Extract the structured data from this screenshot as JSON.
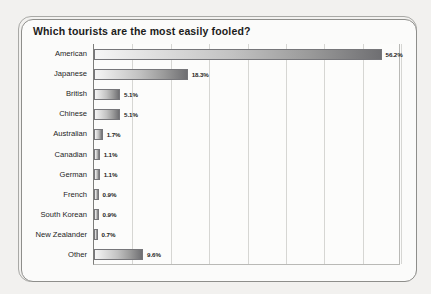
{
  "chart_data": {
    "type": "bar",
    "orientation": "horizontal",
    "title": "Which tourists are the most easily fooled?",
    "xlabel": "",
    "ylabel": "",
    "categories": [
      "American",
      "Japanese",
      "British",
      "Chinese",
      "Australian",
      "Canadian",
      "German",
      "French",
      "South Korean",
      "New Zealander",
      "Other"
    ],
    "values": [
      56.2,
      18.3,
      5.1,
      5.1,
      1.7,
      1.1,
      1.1,
      0.9,
      0.9,
      0.7,
      9.6
    ],
    "value_labels": [
      "56.2%",
      "18.3%",
      "5.1%",
      "5.1%",
      "1.7%",
      "1.1%",
      "1.1%",
      "0.9%",
      "0.9%",
      "0.7%",
      "9.6%"
    ],
    "xlim": [
      0,
      60
    ],
    "gridlines_at": [
      0,
      7.5,
      15,
      22.5,
      30,
      37.5,
      45,
      52.5,
      60
    ],
    "grid": true,
    "legend": "none",
    "bar_gradient_from": "#f6f6f6",
    "bar_gradient_to": "#6f6f72",
    "bar_border_color": "#76767a",
    "plot_background": "#fcfcfb",
    "page_background": "#f2f1ef",
    "title_color": "#1b1b1b"
  }
}
